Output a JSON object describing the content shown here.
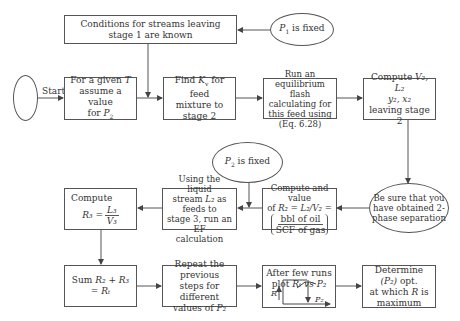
{
  "diagram": {
    "type": "flowchart",
    "nodes": {
      "start_ellipse": {
        "label": ""
      },
      "start_label": "Start",
      "conditions": {
        "text": "Conditions for streams leaving stage 1 are known"
      },
      "p1_fixed": {
        "var": "P",
        "sub": "1",
        "text": " is fixed"
      },
      "given_t": {
        "line1_pre": "For a given ",
        "line1_var": "T",
        "line2": "assume a value",
        "line3_pre": "for ",
        "line3_var": "P",
        "line3_sub": "2"
      },
      "find_kv": {
        "line1_pre": "Find ",
        "line1_var": "K",
        "line1_sub": "v",
        "line1_post": " for feed",
        "line2": "mixture to",
        "line3": "stage 2"
      },
      "run_flash": {
        "line1": "Run an equilibrium",
        "line2": "flash calculating for",
        "line3": "this feed using",
        "line4": "(Eq. 6.28)"
      },
      "compute_v2": {
        "line1_pre": "Compute ",
        "line1_vars": "V₂, L₂",
        "line2_vars": "y₂, x₂",
        "line3": "leaving stage 2"
      },
      "p2_fixed": {
        "var": "P",
        "sub": "2",
        "text": " is fixed"
      },
      "be_sure": {
        "line1": "Be sure that you",
        "line2": "have obtained 2-",
        "line3": "phase separation"
      },
      "compute_value": {
        "line1": "Compute and value",
        "line2_pre": "of ",
        "line2_expr": "R₂ = L₂/V₂ =",
        "num": "bbl of oil",
        "den": "SCF of gas"
      },
      "using_liquid": {
        "line1": "Using the liquid",
        "line2_pre": "stream ",
        "line2_var": "L₂",
        "line2_post": " as feeds to",
        "line3": "stage 3, run an EF",
        "line4": "calculation"
      },
      "compute_r3": {
        "line1": "Compute",
        "lhs": "R₃ =",
        "num": "L₃",
        "den": "V₃"
      },
      "sum": {
        "pre": "Sum ",
        "expr": "R₂ + R₃ = Rₜ"
      },
      "repeat": {
        "line1": "Repeat the previous",
        "line2": "steps for different",
        "line3_pre": "values of ",
        "line3_var": "P₂"
      },
      "after_runs": {
        "line1": "After few runs",
        "line2_pre": "plot ",
        "line2_expr": "Rₜ vs P₂",
        "axis_y": "R",
        "axis_x": "P₂"
      },
      "determine": {
        "line1_pre": "Determine ",
        "line1_var": "(P₂)",
        "line1_post": " opt.",
        "line2_pre": "at which ",
        "line2_var": "R",
        "line2_post": " is",
        "line3": "maximum"
      }
    },
    "edges": [
      [
        "start_ellipse",
        "given_t"
      ],
      [
        "p1_fixed",
        "conditions"
      ],
      [
        "conditions",
        "find_kv"
      ],
      [
        "given_t",
        "find_kv"
      ],
      [
        "find_kv",
        "run_flash"
      ],
      [
        "run_flash",
        "compute_v2"
      ],
      [
        "compute_v2",
        "be_sure"
      ],
      [
        "be_sure",
        "compute_value"
      ],
      [
        "compute_value",
        "using_liquid"
      ],
      [
        "p2_fixed",
        "using_liquid"
      ],
      [
        "using_liquid",
        "compute_r3"
      ],
      [
        "compute_r3",
        "sum"
      ],
      [
        "sum",
        "repeat"
      ],
      [
        "repeat",
        "after_runs"
      ],
      [
        "after_runs",
        "determine"
      ]
    ],
    "colors": {
      "stroke": "#555555",
      "text": "#333333",
      "background": "#ffffff"
    }
  }
}
